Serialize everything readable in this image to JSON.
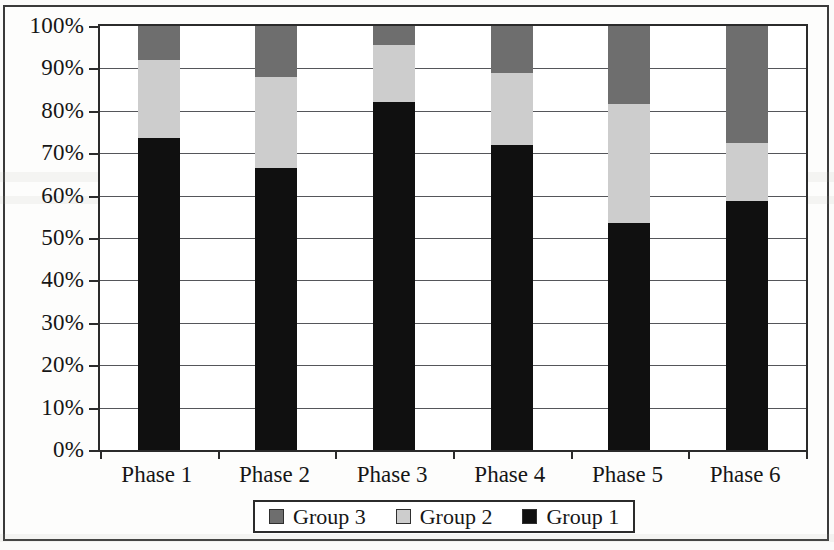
{
  "chart_data": {
    "type": "bar",
    "subtype": "stacked-bar-100-percent",
    "title": "",
    "subtitle": "",
    "xlabel": "",
    "ylabel": "",
    "categories": [
      "Phase 1",
      "Phase 2",
      "Phase 3",
      "Phase 4",
      "Phase 5",
      "Phase 6"
    ],
    "series": [
      {
        "name": "Group 1",
        "color": "#101010",
        "values": [
          73.5,
          66.6,
          82.0,
          72.0,
          53.5,
          58.7
        ]
      },
      {
        "name": "Group 2",
        "color": "#cdcdcd",
        "values": [
          18.5,
          21.4,
          13.5,
          17.0,
          28.0,
          13.8
        ]
      },
      {
        "name": "Group 3",
        "color": "#6e6e6e",
        "values": [
          8.0,
          12.0,
          4.5,
          11.0,
          18.5,
          27.5
        ]
      }
    ],
    "stack_order_bottom_to_top": [
      "Group 1",
      "Group 2",
      "Group 3"
    ],
    "ylim": [
      0,
      100
    ],
    "yticks": [
      0,
      10,
      20,
      30,
      40,
      50,
      60,
      70,
      80,
      90,
      100
    ],
    "ytick_labels": [
      "0%",
      "10%",
      "20%",
      "30%",
      "40%",
      "50%",
      "60%",
      "70%",
      "80%",
      "90%",
      "100%"
    ],
    "grid": true,
    "grid_axis": "y",
    "legend_position": "bottom-center",
    "legend_entries": [
      "Group 3",
      "Group 2",
      "Group 1"
    ],
    "cumulative_boundaries_percent": {
      "Phase 1": [
        73.5,
        92.0,
        100
      ],
      "Phase 2": [
        66.6,
        88.0,
        100
      ],
      "Phase 3": [
        82.0,
        95.5,
        100
      ],
      "Phase 4": [
        72.0,
        89.0,
        100
      ],
      "Phase 5": [
        53.5,
        81.5,
        100
      ],
      "Phase 6": [
        58.7,
        72.5,
        100
      ]
    }
  },
  "legend": {
    "entries": [
      {
        "label": "Group 3",
        "color": "#6e6e6e"
      },
      {
        "label": "Group 2",
        "color": "#cdcdcd"
      },
      {
        "label": "Group 1",
        "color": "#101010"
      }
    ]
  },
  "colors": {
    "group1": "#101010",
    "group2": "#cdcdcd",
    "group3": "#6e6e6e",
    "axis": "#2b2b2b",
    "gridline": "#55565a",
    "frame": "#3a3a3a",
    "background": "#ffffff"
  }
}
